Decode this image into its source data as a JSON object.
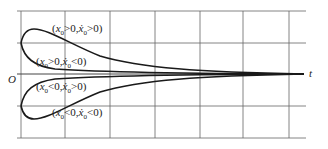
{
  "diagram": {
    "type": "phase-response-plot",
    "axis": {
      "origin_label": "O",
      "x_label": "t"
    },
    "grid": {
      "vertical_x": [
        21,
        65,
        110,
        155,
        200,
        243,
        289
      ],
      "horizontal_y": [
        11,
        43,
        74,
        106,
        138
      ],
      "x_start": 17,
      "x_end": 306
    },
    "curves": [
      {
        "id": "pos-pos",
        "label": "(x₀>0, ẋ₀>0)",
        "condition": {
          "x0": ">0",
          "xdot0": ">0"
        }
      },
      {
        "id": "pos-neg",
        "label": "(x₀>0, ẋ₀<0)",
        "condition": {
          "x0": ">0",
          "xdot0": "<0"
        }
      },
      {
        "id": "neg-pos",
        "label": "(x₀<0, ẋ₀>0)",
        "condition": {
          "x0": "<0",
          "xdot0": ">0"
        }
      },
      {
        "id": "neg-neg",
        "label": "(x₀<0, ẋ₀<0)",
        "condition": {
          "x0": "<0",
          "xdot0": "<0"
        }
      }
    ],
    "colors": {
      "grid": "#555555",
      "curve": "#1a1a1a",
      "background": "#ffffff"
    }
  },
  "labels": {
    "pos_pos": {
      "pre": "(",
      "x": "x",
      "sub1": "0",
      "rel1": ">0,",
      "xd": "ẋ",
      "sub2": "0",
      "rel2": ">0)"
    },
    "pos_neg": {
      "pre": "(",
      "x": "x",
      "sub1": "0",
      "rel1": ">0,",
      "xd": "ẋ",
      "sub2": "0",
      "rel2": "<0)"
    },
    "neg_pos": {
      "pre": "(",
      "x": "x",
      "sub1": "0",
      "rel1": "<0,",
      "xd": "ẋ",
      "sub2": "0",
      "rel2": ">0)"
    },
    "neg_neg": {
      "pre": "(",
      "x": "x",
      "sub1": "0",
      "rel1": "<0,",
      "xd": "ẋ",
      "sub2": "0",
      "rel2": "<0)"
    }
  }
}
